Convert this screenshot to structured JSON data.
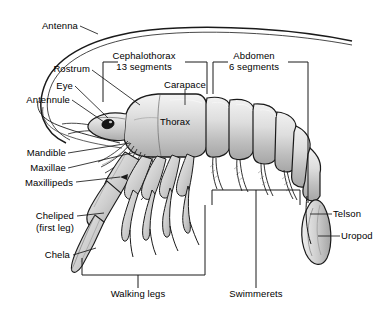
{
  "diagram": {
    "background_color": "#ffffff",
    "line_color": "#1a1a1a",
    "body_fill_light": "#e8e8e8",
    "body_fill_mid": "#c9c9c9",
    "body_fill_dark": "#a8a8a8",
    "eye_color": "#111111"
  },
  "labels": {
    "antenna": "Antenna",
    "rostrum": "Rostrum",
    "eye": "Eye",
    "antennule": "Antennule",
    "mandible": "Mandible",
    "maxillae": "Maxillae",
    "maxillipeds": "Maxillipeds",
    "cheliped": "Cheliped",
    "cheliped_sub": "(first leg)",
    "chela": "Chela",
    "cephalothorax": "Cephalothorax",
    "cephalothorax_sub": "13 segments",
    "carapace": "Carapace",
    "thorax": "Thorax",
    "abdomen": "Abdomen",
    "abdomen_sub": "6 segments",
    "telson": "Telson",
    "uropod": "Uropod",
    "walking_legs": "Walking legs",
    "swimmerets": "Swimmerets"
  }
}
